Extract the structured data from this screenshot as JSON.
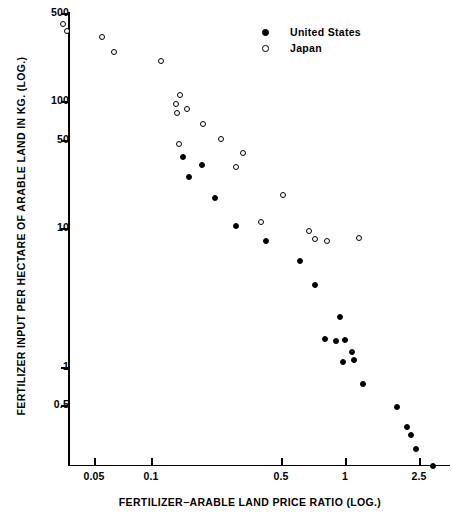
{
  "chart_data": {
    "type": "scatter",
    "title": "",
    "xlabel": "FERTILIZER−ARABLE LAND PRICE RATIO (LOG.)",
    "ylabel": "FERTILIZER INPUT PER HECTARE OF ARABLE LAND IN KG. (LOG.)",
    "xscale": "log",
    "yscale": "log",
    "xlim": [
      0.03,
      3.2
    ],
    "ylim": [
      0.35,
      600
    ],
    "grid": false,
    "legend_position": "top-right",
    "xticks": [
      {
        "value": 0.05,
        "label": "0.05",
        "px": 94
      },
      {
        "value": 0.1,
        "label": "0.1",
        "px": 151
      },
      {
        "value": 0.5,
        "label": "0.5",
        "px": 281
      },
      {
        "value": 1,
        "label": "1",
        "px": 345
      },
      {
        "value": 2.5,
        "label": "2.5",
        "px": 419
      }
    ],
    "yticks": [
      {
        "value": 500,
        "label": "500",
        "px": 13
      },
      {
        "value": 100,
        "label": "100",
        "px": 101
      },
      {
        "value": 50,
        "label": "50",
        "px": 140
      },
      {
        "value": 10,
        "label": "10",
        "px": 228
      },
      {
        "value": 1,
        "label": "1",
        "px": 367
      },
      {
        "value": 0.5,
        "label": "0.5",
        "px": 405
      }
    ],
    "series": [
      {
        "name": "Japan",
        "marker": "open-circle",
        "color": "#000000",
        "points": [
          {
            "x": 0.037,
            "y": 430,
            "px": 63,
            "py": 24
          },
          {
            "x": 0.039,
            "y": 350,
            "px": 67,
            "py": 31
          },
          {
            "x": 0.063,
            "y": 300,
            "px": 102,
            "py": 37
          },
          {
            "x": 0.079,
            "y": 230,
            "px": 114,
            "py": 52
          },
          {
            "x": 0.125,
            "y": 200,
            "px": 161,
            "py": 61
          },
          {
            "x": 0.153,
            "y": 130,
            "px": 180,
            "py": 95
          },
          {
            "x": 0.148,
            "y": 115,
            "px": 176,
            "py": 104
          },
          {
            "x": 0.163,
            "y": 105,
            "px": 187,
            "py": 109
          },
          {
            "x": 0.149,
            "y": 98,
            "px": 177,
            "py": 113
          },
          {
            "x": 0.186,
            "y": 88,
            "px": 203,
            "py": 124
          },
          {
            "x": 0.215,
            "y": 70,
            "px": 221,
            "py": 139
          },
          {
            "x": 0.152,
            "y": 64,
            "px": 179,
            "py": 144
          },
          {
            "x": 0.256,
            "y": 58,
            "px": 243,
            "py": 153
          },
          {
            "x": 0.243,
            "y": 46,
            "px": 236,
            "py": 167
          },
          {
            "x": 0.37,
            "y": 26,
            "px": 283,
            "py": 195
          },
          {
            "x": 0.31,
            "y": 19,
            "px": 261,
            "py": 222
          },
          {
            "x": 0.55,
            "y": 16.5,
            "px": 309,
            "py": 231
          },
          {
            "x": 0.59,
            "y": 14.5,
            "px": 315,
            "py": 239
          },
          {
            "x": 0.69,
            "y": 14,
            "px": 327,
            "py": 241
          },
          {
            "x": 0.97,
            "y": 14.5,
            "px": 359,
            "py": 238
          }
        ]
      },
      {
        "name": "United States",
        "marker": "filled-circle",
        "color": "#000000",
        "points": [
          {
            "x": 0.157,
            "y": 48,
            "px": 183,
            "py": 157
          },
          {
            "x": 0.185,
            "y": 42,
            "px": 202,
            "py": 165
          },
          {
            "x": 0.166,
            "y": 34,
            "px": 189,
            "py": 177
          },
          {
            "x": 0.22,
            "y": 22,
            "px": 215,
            "py": 198
          },
          {
            "x": 0.32,
            "y": 17,
            "px": 236,
            "py": 226
          },
          {
            "x": 0.42,
            "y": 13.5,
            "px": 266,
            "py": 241
          },
          {
            "x": 0.52,
            "y": 11,
            "px": 300,
            "py": 261
          },
          {
            "x": 0.63,
            "y": 7.2,
            "px": 315,
            "py": 285
          },
          {
            "x": 0.81,
            "y": 4.3,
            "px": 340,
            "py": 317
          },
          {
            "x": 0.72,
            "y": 3.0,
            "px": 325,
            "py": 339
          },
          {
            "x": 0.78,
            "y": 2.9,
            "px": 336,
            "py": 341
          },
          {
            "x": 0.85,
            "y": 2.95,
            "px": 345,
            "py": 340
          },
          {
            "x": 0.9,
            "y": 2.4,
            "px": 352,
            "py": 352
          },
          {
            "x": 0.83,
            "y": 2.1,
            "px": 343,
            "py": 362
          },
          {
            "x": 0.92,
            "y": 2.2,
            "px": 354,
            "py": 360
          },
          {
            "x": 1.05,
            "y": 1.4,
            "px": 363,
            "py": 384
          },
          {
            "x": 1.6,
            "y": 0.78,
            "px": 397,
            "py": 407
          },
          {
            "x": 1.9,
            "y": 0.56,
            "px": 407,
            "py": 427
          },
          {
            "x": 2.0,
            "y": 0.51,
            "px": 411,
            "py": 435
          },
          {
            "x": 2.2,
            "y": 0.43,
            "px": 416,
            "py": 449
          },
          {
            "x": 2.75,
            "y": 0.35,
            "px": 433,
            "py": 466
          }
        ]
      }
    ]
  },
  "legend": {
    "items": [
      {
        "label": "United States",
        "marker": "filled-circle"
      },
      {
        "label": "Japan",
        "marker": "open-circle"
      }
    ]
  }
}
